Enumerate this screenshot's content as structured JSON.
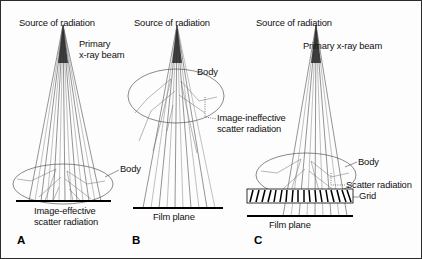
{
  "figure": {
    "type": "scientific-diagram",
    "panels": [
      {
        "letter": "A",
        "source_label": "Source of radiation",
        "beam_label": "Primary\nx-ray beam",
        "body_label": "Body",
        "scatter_label": "Image-effective\nscatter radiation",
        "film_label": "",
        "grid_label": "",
        "has_grid": false,
        "has_film_plane": true,
        "body_on_film": true
      },
      {
        "letter": "B",
        "source_label": "Source of radiation",
        "beam_label": "",
        "body_label": "Body",
        "scatter_label": "Image-ineffective\nscatter radiation",
        "film_label": "Film plane",
        "grid_label": "",
        "has_grid": false,
        "has_film_plane": true,
        "body_on_film": false
      },
      {
        "letter": "C",
        "source_label": "Source of radiation",
        "beam_label": "Primary x-ray beam",
        "body_label": "Body",
        "scatter_label": "Scatter radiation",
        "film_label": "Film plane",
        "grid_label": "Grid",
        "has_grid": true,
        "has_film_plane": true,
        "body_on_film": false
      }
    ],
    "colors": {
      "ink": "#000000",
      "beam_gray": "#8d8d8d",
      "outline_gray": "#4a4a4a",
      "background": "#fdfdfd",
      "border": "#2b2b2b"
    },
    "labels": {
      "a_source": "Source of radiation",
      "a_beam_line1": "Primary",
      "a_beam_line2": "x-ray beam",
      "a_body": "Body",
      "a_scatter_line1": "Image-effective",
      "a_scatter_line2": "scatter radiation",
      "a_letter": "A",
      "b_source": "Source of radiation",
      "b_body": "Body",
      "b_scatter_line1": "Image-ineffective",
      "b_scatter_line2": "scatter radiation",
      "b_film": "Film plane",
      "b_letter": "B",
      "c_source": "Source of radiation",
      "c_beam": "Primary x-ray beam",
      "c_body": "Body",
      "c_scatter": "Scatter radiation",
      "c_grid": "Grid",
      "c_film": "Film plane",
      "c_letter": "C"
    }
  }
}
